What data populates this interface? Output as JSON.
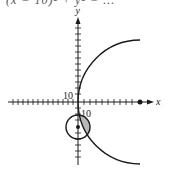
{
  "caption_clipped": "(x − 10)² + y² = …",
  "axes": {
    "x_label": "x",
    "y_label": "y",
    "tick_label_y": "10",
    "tick_label_x": "10"
  },
  "colors": {
    "ink": "#1a1a1a",
    "shade": "#b8b8b8"
  },
  "figure": {
    "small_circle": {
      "center": [
        0,
        -5
      ],
      "radius": 5
    },
    "large_arc_center_marked": true
  }
}
